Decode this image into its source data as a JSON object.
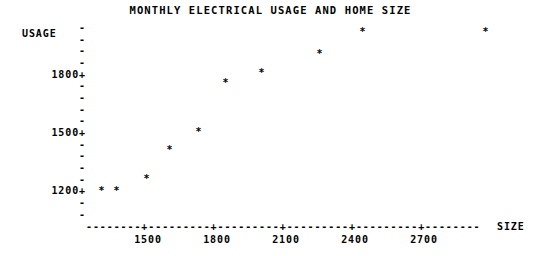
{
  "chart_data": {
    "type": "scatter",
    "title": "MONTHLY ELECTRICAL USAGE AND HOME SIZE",
    "xlabel": "SIZE",
    "ylabel": "USAGE",
    "marker": "*",
    "grid": false,
    "legend": null,
    "xlim": [
      1290,
      3150
    ],
    "ylim": [
      1130,
      2105
    ],
    "x_ticks": [
      1500,
      1800,
      2100,
      2400,
      2700
    ],
    "x_tick_labels": [
      "1500",
      "1800",
      "2100",
      "2400",
      "2700"
    ],
    "y_ticks": [
      1200,
      1500,
      1800
    ],
    "y_tick_labels": [
      "1200+",
      "1500+",
      "1800+"
    ],
    "y_minor_tick_count_between": 4,
    "axis_rule": "--------+---------+---------+---------+---------+--------",
    "points": [
      {
        "x": 1400,
        "y": 1200
      },
      {
        "x": 1465,
        "y": 1200
      },
      {
        "x": 1595,
        "y": 1265
      },
      {
        "x": 1695,
        "y": 1420
      },
      {
        "x": 1820,
        "y": 1515
      },
      {
        "x": 1935,
        "y": 1770
      },
      {
        "x": 2090,
        "y": 1825
      },
      {
        "x": 2340,
        "y": 1925
      },
      {
        "x": 2525,
        "y": 2040
      },
      {
        "x": 3060,
        "y": 2040
      }
    ]
  },
  "axis_geometry": {
    "tick_glyph": "-",
    "y_rows": [
      {
        "label": "",
        "y_px": 22
      },
      {
        "label": "",
        "y_px": 34
      },
      {
        "label": "",
        "y_px": 45
      },
      {
        "label": "",
        "y_px": 57
      },
      {
        "label": "1800+",
        "y_px": 69
      },
      {
        "label": "",
        "y_px": 80
      },
      {
        "label": "",
        "y_px": 92
      },
      {
        "label": "",
        "y_px": 104
      },
      {
        "label": "",
        "y_px": 115
      },
      {
        "label": "1500+",
        "y_px": 127
      },
      {
        "label": "",
        "y_px": 139
      },
      {
        "label": "",
        "y_px": 150
      },
      {
        "label": "",
        "y_px": 162
      },
      {
        "label": "",
        "y_px": 174
      },
      {
        "label": "1200+",
        "y_px": 185
      },
      {
        "label": "",
        "y_px": 197
      },
      {
        "label": "",
        "y_px": 209
      }
    ],
    "x_tick_px": [
      148,
      217,
      286,
      355,
      424
    ],
    "point_px": [
      {
        "x": 101,
        "y": 186
      },
      {
        "x": 116,
        "y": 186
      },
      {
        "x": 146,
        "y": 174
      },
      {
        "x": 169,
        "y": 145
      },
      {
        "x": 198,
        "y": 127
      },
      {
        "x": 225,
        "y": 78
      },
      {
        "x": 261,
        "y": 68
      },
      {
        "x": 319,
        "y": 49
      },
      {
        "x": 362,
        "y": 27
      },
      {
        "x": 485,
        "y": 27
      }
    ]
  }
}
